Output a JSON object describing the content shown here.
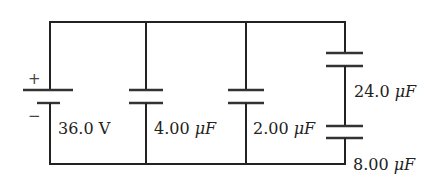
{
  "diagram": {
    "type": "circuit",
    "battery": {
      "voltage_label": "36.0 V",
      "plus_sign": "+",
      "minus_sign": "−"
    },
    "capacitors": [
      {
        "id": "C1",
        "value": "4.00",
        "unit": "μF",
        "position": "branch-2"
      },
      {
        "id": "C2",
        "value": "2.00",
        "unit": "μF",
        "position": "branch-3"
      },
      {
        "id": "C3",
        "value": "24.0",
        "unit": "μF",
        "position": "branch-4-top"
      },
      {
        "id": "C4",
        "value": "8.00",
        "unit": "μF",
        "position": "branch-4-bottom"
      }
    ],
    "colors": {
      "wire": "#222222",
      "background": "#ffffff"
    }
  }
}
